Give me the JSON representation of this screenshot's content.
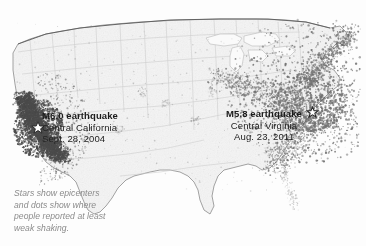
{
  "figure": {
    "name": "us-shakemap-comparison",
    "background_color": "#fdfdfd"
  },
  "map": {
    "region": "contiguous-united-states",
    "land_fill": "#f2f2f2",
    "border_color": "#6e6e6e",
    "state_border_color": "#cfcfcf",
    "dot_color": "#555555",
    "dense_dot_color": "#4a4a4a"
  },
  "annotations": {
    "california": {
      "title": "M6.0 earthquake",
      "place": "Central California",
      "date": "Sept. 28, 2004",
      "epicenter_icon": "star-icon"
    },
    "virginia": {
      "title": "M5.8 earthquake",
      "place": "Central Virginia",
      "date": "Aug. 23, 2011",
      "epicenter_icon": "star-icon"
    }
  },
  "caption": {
    "line1": "Stars show epicenters",
    "line2": "and dots show where",
    "line3": "people reported at least",
    "line4": "weak shaking."
  },
  "legend_semantics": {
    "star_meaning": "epicenter",
    "dot_meaning": "reported at least weak shaking"
  }
}
